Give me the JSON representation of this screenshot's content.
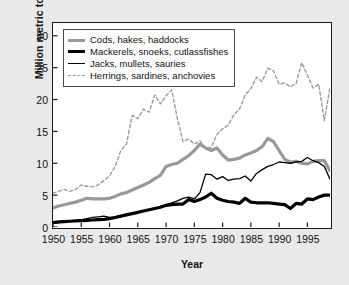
{
  "chart_data": {
    "type": "line",
    "title": "",
    "xlabel": "Year",
    "ylabel": "Million metric tons",
    "xlim": [
      1950,
      1999
    ],
    "ylim": [
      0,
      32
    ],
    "ytick_labels": [
      "0",
      "5",
      "10",
      "15",
      "20",
      "25",
      "30"
    ],
    "yticks": [
      0,
      5,
      10,
      15,
      20,
      25,
      30
    ],
    "xtick_labels": [
      "1950",
      "1955",
      "1960",
      "1965",
      "1970",
      "1975",
      "1980",
      "1985",
      "1990",
      "1995"
    ],
    "xticks": [
      1950,
      1955,
      1960,
      1965,
      1970,
      1975,
      1980,
      1985,
      1990,
      1995
    ],
    "grid": false,
    "legend_position": "top-left",
    "x": [
      1950,
      1951,
      1952,
      1953,
      1954,
      1955,
      1956,
      1957,
      1958,
      1959,
      1960,
      1961,
      1962,
      1963,
      1964,
      1965,
      1966,
      1967,
      1968,
      1969,
      1970,
      1971,
      1972,
      1973,
      1974,
      1975,
      1976,
      1977,
      1978,
      1979,
      1980,
      1981,
      1982,
      1983,
      1984,
      1985,
      1986,
      1987,
      1988,
      1989,
      1990,
      1991,
      1992,
      1993,
      1994,
      1995,
      1996,
      1997,
      1998,
      1999
    ],
    "series": [
      {
        "name": "Cods, hakes, haddocks",
        "color": "#999999",
        "style": "solid",
        "width": 3.2,
        "values": [
          3.0,
          3.3,
          3.5,
          3.7,
          3.9,
          4.2,
          4.5,
          4.4,
          4.4,
          4.4,
          4.5,
          4.8,
          5.2,
          5.4,
          5.8,
          6.2,
          6.6,
          7.0,
          7.6,
          8.1,
          9.5,
          9.8,
          10.0,
          10.6,
          11.2,
          12.0,
          13.0,
          12.4,
          12.0,
          12.4,
          11.3,
          10.5,
          10.6,
          10.8,
          11.3,
          11.6,
          12.0,
          12.6,
          13.9,
          13.4,
          12.0,
          10.6,
          10.2,
          10.3,
          10.0,
          9.9,
          10.3,
          10.4,
          10.4,
          8.8
        ]
      },
      {
        "name": "Mackerels, snoeks, cutlassfishes",
        "color": "#000000",
        "style": "solid",
        "width": 3.2,
        "values": [
          0.7,
          0.8,
          0.85,
          0.9,
          0.95,
          1.0,
          1.05,
          1.1,
          1.15,
          1.2,
          1.3,
          1.5,
          1.7,
          1.9,
          2.1,
          2.3,
          2.5,
          2.7,
          2.9,
          3.1,
          3.4,
          3.5,
          3.6,
          3.6,
          4.3,
          4.0,
          4.3,
          4.7,
          5.3,
          4.5,
          4.2,
          4.0,
          3.9,
          3.7,
          4.5,
          3.9,
          3.8,
          3.8,
          3.8,
          3.7,
          3.6,
          3.5,
          2.9,
          3.7,
          3.6,
          4.4,
          4.3,
          4.7,
          5.0,
          5.0
        ]
      },
      {
        "name": "Jacks, mullets, sauries",
        "color": "#000000",
        "style": "solid",
        "width": 1.3,
        "values": [
          0.6,
          0.7,
          0.8,
          0.9,
          1.0,
          1.1,
          1.3,
          1.5,
          1.6,
          1.7,
          1.5,
          1.6,
          1.8,
          2.0,
          2.1,
          2.3,
          2.5,
          2.7,
          2.9,
          3.2,
          3.5,
          3.8,
          4.1,
          4.5,
          4.7,
          4.4,
          5.4,
          8.3,
          8.2,
          7.5,
          7.9,
          7.3,
          7.5,
          7.6,
          8.0,
          7.2,
          8.4,
          9.0,
          9.5,
          9.8,
          10.2,
          10.1,
          10.0,
          10.2,
          10.3,
          10.9,
          10.4,
          10.1,
          9.5,
          7.5
        ]
      },
      {
        "name": "Herrings, sardines, anchovies",
        "color": "#9a9a9a",
        "style": "dashed",
        "width": 1.4,
        "values": [
          5.3,
          5.6,
          5.9,
          5.6,
          5.9,
          6.6,
          6.4,
          6.3,
          6.6,
          7.3,
          8.0,
          9.5,
          12.0,
          13.0,
          17.5,
          17.0,
          18.5,
          18.0,
          20.7,
          19.3,
          20.6,
          21.5,
          17.0,
          13.4,
          13.8,
          13.0,
          13.5,
          12.3,
          12.5,
          14.5,
          15.4,
          16.0,
          17.6,
          18.5,
          20.7,
          21.7,
          23.5,
          22.8,
          24.9,
          24.5,
          22.4,
          22.6,
          22.0,
          22.5,
          25.8,
          23.8,
          21.8,
          22.4,
          16.7,
          21.9
        ]
      }
    ],
    "legend": [
      {
        "label": "Cods, hakes, haddocks",
        "swatch": "sw-thick-gray"
      },
      {
        "label": "Mackerels, snoeks, cutlassfishes",
        "swatch": "sw-thick-black"
      },
      {
        "label": "Jacks, mullets, sauries",
        "swatch": "sw-thin-black"
      },
      {
        "label": "Herrings, sardines, anchovies",
        "swatch": "sw-dash-gray"
      }
    ]
  }
}
